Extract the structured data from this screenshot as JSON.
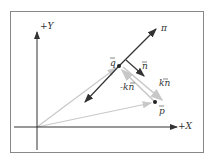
{
  "diagram": {
    "title": "",
    "type": "vector projection onto plane",
    "axes": {
      "x_label": "+X",
      "y_label": "+Y"
    },
    "labels": {
      "plane": "π",
      "q": "q",
      "n": "n",
      "p": "p",
      "kn": "kn",
      "minus_kn": "-kn"
    },
    "colors": {
      "line": "#333333",
      "gray_vector": "#c8c8c8",
      "frame": "#888888",
      "background": "#ffffff"
    }
  }
}
